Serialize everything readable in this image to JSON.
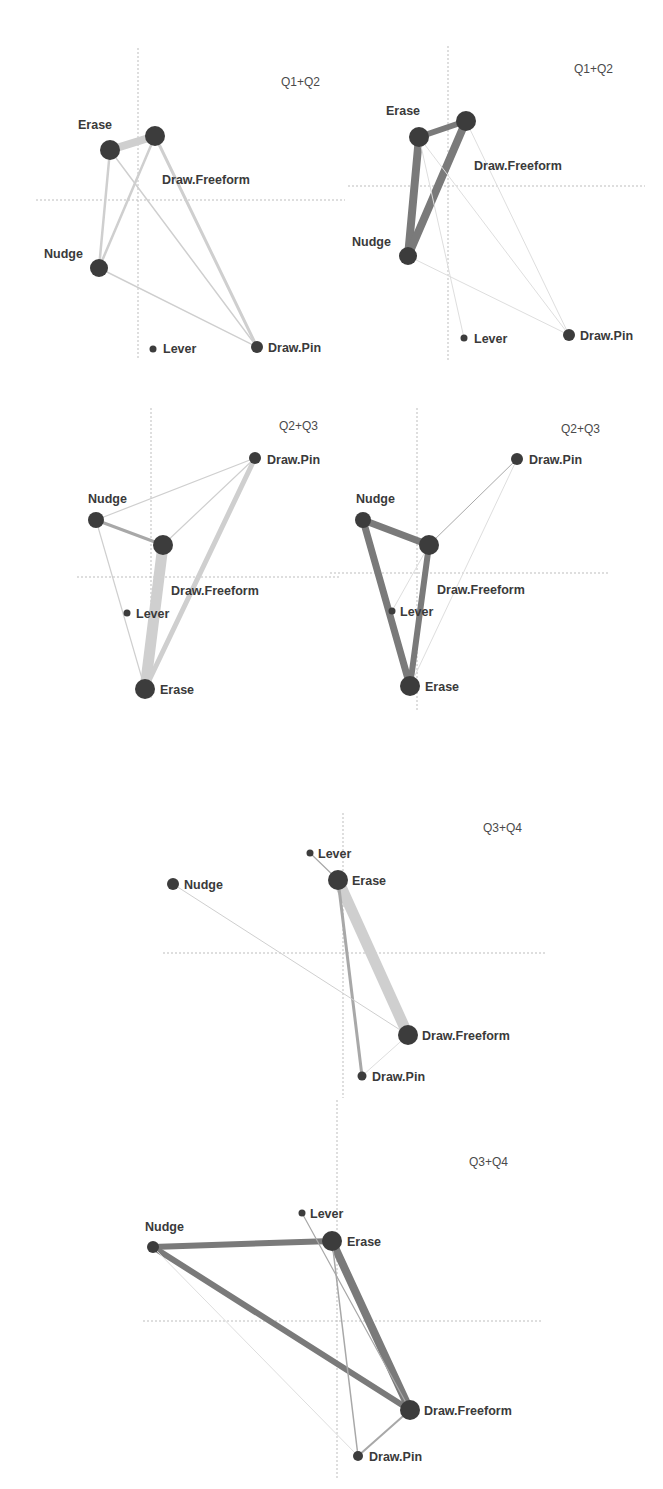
{
  "figure": {
    "width": 663,
    "height": 1489,
    "colors": {
      "node": "#3c3c3c",
      "label": "#3a3a3a",
      "axis": "#bdbdbd",
      "edge_light": "#cfcfcf",
      "edge_mid": "#a8a8a8",
      "edge_dark": "#7a7a7a",
      "edge_faint": "#dedede"
    }
  },
  "panels": [
    {
      "id": "q1q2-left",
      "title": "Q1+Q2",
      "title_pos": [
        281,
        86
      ],
      "axes": {
        "v": {
          "x": 138,
          "y1": 48,
          "y2": 360
        },
        "h": {
          "y": 200,
          "x1": 36,
          "x2": 345
        }
      },
      "nodes": [
        {
          "name": "Erase",
          "x": 110,
          "y": 150,
          "r": 10,
          "label": "Erase",
          "lx": 78,
          "ly": 129
        },
        {
          "name": "Draw.Freeform",
          "x": 155,
          "y": 136,
          "r": 10,
          "label": "Draw.Freeform",
          "lx": 162,
          "ly": 184
        },
        {
          "name": "Nudge",
          "x": 99,
          "y": 268,
          "r": 9,
          "label": "Nudge",
          "lx": 44,
          "ly": 258
        },
        {
          "name": "Lever",
          "x": 153,
          "y": 349,
          "r": 3.5,
          "label": "Lever",
          "lx": 163,
          "ly": 353
        },
        {
          "name": "Draw.Pin",
          "x": 257,
          "y": 347,
          "r": 6,
          "label": "Draw.Pin",
          "lx": 268,
          "ly": 352
        }
      ],
      "edges": [
        {
          "from": "Erase",
          "to": "Draw.Freeform",
          "w": 8,
          "tone": "edge_light"
        },
        {
          "from": "Erase",
          "to": "Nudge",
          "w": 2.5,
          "tone": "edge_light"
        },
        {
          "from": "Draw.Freeform",
          "to": "Nudge",
          "w": 2.5,
          "tone": "edge_light"
        },
        {
          "from": "Draw.Freeform",
          "to": "Draw.Pin",
          "w": 3,
          "tone": "edge_light"
        },
        {
          "from": "Erase",
          "to": "Draw.Pin",
          "w": 1.5,
          "tone": "edge_light"
        },
        {
          "from": "Nudge",
          "to": "Draw.Pin",
          "w": 1.5,
          "tone": "edge_light"
        }
      ]
    },
    {
      "id": "q1q2-right",
      "title": "Q1+Q2",
      "title_pos": [
        574,
        73
      ],
      "axes": {
        "v": {
          "x": 448,
          "y1": 46,
          "y2": 360
        },
        "h": {
          "y": 186,
          "x1": 348,
          "x2": 645
        }
      },
      "nodes": [
        {
          "name": "Erase",
          "x": 419,
          "y": 137,
          "r": 10,
          "label": "Erase",
          "lx": 386,
          "ly": 115
        },
        {
          "name": "Draw.Freeform",
          "x": 466,
          "y": 121,
          "r": 10,
          "label": "Draw.Freeform",
          "lx": 474,
          "ly": 170
        },
        {
          "name": "Nudge",
          "x": 408,
          "y": 256,
          "r": 9,
          "label": "Nudge",
          "lx": 352,
          "ly": 246
        },
        {
          "name": "Lever",
          "x": 464,
          "y": 338,
          "r": 3.5,
          "label": "Lever",
          "lx": 474,
          "ly": 343
        },
        {
          "name": "Draw.Pin",
          "x": 569,
          "y": 335,
          "r": 6,
          "label": "Draw.Pin",
          "lx": 580,
          "ly": 340
        }
      ],
      "edges": [
        {
          "from": "Erase",
          "to": "Draw.Freeform",
          "w": 6,
          "tone": "edge_dark"
        },
        {
          "from": "Erase",
          "to": "Nudge",
          "w": 8,
          "tone": "edge_dark"
        },
        {
          "from": "Draw.Freeform",
          "to": "Nudge",
          "w": 8,
          "tone": "edge_dark"
        },
        {
          "from": "Draw.Freeform",
          "to": "Draw.Pin",
          "w": 1,
          "tone": "edge_faint"
        },
        {
          "from": "Erase",
          "to": "Lever",
          "w": 1,
          "tone": "edge_faint"
        },
        {
          "from": "Erase",
          "to": "Draw.Pin",
          "w": 1,
          "tone": "edge_faint"
        },
        {
          "from": "Nudge",
          "to": "Draw.Pin",
          "w": 1,
          "tone": "edge_faint"
        }
      ]
    },
    {
      "id": "q2q3-left",
      "title": "Q2+Q3",
      "title_pos": [
        279,
        430
      ],
      "axes": {
        "v": {
          "x": 151,
          "y1": 408,
          "y2": 700
        },
        "h": {
          "y": 577,
          "x1": 77,
          "x2": 340
        }
      },
      "nodes": [
        {
          "name": "Draw.Pin",
          "x": 255,
          "y": 458,
          "r": 6,
          "label": "Draw.Pin",
          "lx": 267,
          "ly": 464
        },
        {
          "name": "Nudge",
          "x": 96,
          "y": 520,
          "r": 8,
          "label": "Nudge",
          "lx": 88,
          "ly": 503
        },
        {
          "name": "Draw.Freeform",
          "x": 163,
          "y": 545,
          "r": 10,
          "label": "Draw.Freeform",
          "lx": 171,
          "ly": 595
        },
        {
          "name": "Lever",
          "x": 127,
          "y": 613,
          "r": 3.5,
          "label": "Lever",
          "lx": 136,
          "ly": 618
        },
        {
          "name": "Erase",
          "x": 145,
          "y": 689,
          "r": 10,
          "label": "Erase",
          "lx": 160,
          "ly": 694
        }
      ],
      "edges": [
        {
          "from": "Nudge",
          "to": "Draw.Pin",
          "w": 1.2,
          "tone": "edge_light"
        },
        {
          "from": "Nudge",
          "to": "Draw.Freeform",
          "w": 3,
          "tone": "edge_mid"
        },
        {
          "from": "Draw.Freeform",
          "to": "Draw.Pin",
          "w": 1.2,
          "tone": "edge_light"
        },
        {
          "from": "Draw.Freeform",
          "to": "Erase",
          "w": 11,
          "tone": "edge_light"
        },
        {
          "from": "Draw.Pin",
          "to": "Erase",
          "w": 5,
          "tone": "edge_light"
        },
        {
          "from": "Nudge",
          "to": "Erase",
          "w": 1.2,
          "tone": "edge_light"
        }
      ]
    },
    {
      "id": "q2q3-right",
      "title": "Q2+Q3",
      "title_pos": [
        561,
        433
      ],
      "axes": {
        "v": {
          "x": 417,
          "y1": 408,
          "y2": 710
        },
        "h": {
          "y": 573,
          "x1": 330,
          "x2": 608
        }
      },
      "nodes": [
        {
          "name": "Draw.Pin",
          "x": 517,
          "y": 459,
          "r": 6,
          "label": "Draw.Pin",
          "lx": 529,
          "ly": 464
        },
        {
          "name": "Nudge",
          "x": 363,
          "y": 520,
          "r": 8,
          "label": "Nudge",
          "lx": 356,
          "ly": 503
        },
        {
          "name": "Draw.Freeform",
          "x": 429,
          "y": 545,
          "r": 10,
          "label": "Draw.Freeform",
          "lx": 437,
          "ly": 594
        },
        {
          "name": "Lever",
          "x": 392,
          "y": 611,
          "r": 3.5,
          "label": "Lever",
          "lx": 400,
          "ly": 616
        },
        {
          "name": "Erase",
          "x": 410,
          "y": 686,
          "r": 10,
          "label": "Erase",
          "lx": 425,
          "ly": 691
        }
      ],
      "edges": [
        {
          "from": "Nudge",
          "to": "Draw.Freeform",
          "w": 7,
          "tone": "edge_dark"
        },
        {
          "from": "Nudge",
          "to": "Erase",
          "w": 7,
          "tone": "edge_dark"
        },
        {
          "from": "Draw.Freeform",
          "to": "Erase",
          "w": 6,
          "tone": "edge_dark"
        },
        {
          "from": "Draw.Freeform",
          "to": "Draw.Pin",
          "w": 1,
          "tone": "edge_mid"
        },
        {
          "from": "Draw.Pin",
          "to": "Erase",
          "w": 1,
          "tone": "edge_faint"
        },
        {
          "from": "Draw.Freeform",
          "to": "Lever",
          "w": 1,
          "tone": "edge_faint"
        }
      ]
    },
    {
      "id": "q3q4-top",
      "title": "Q3+Q4",
      "title_pos": [
        483,
        832
      ],
      "axes": {
        "v": {
          "x": 343,
          "y1": 813,
          "y2": 1098
        },
        "h": {
          "y": 953,
          "x1": 163,
          "x2": 545
        }
      },
      "nodes": [
        {
          "name": "Lever",
          "x": 310,
          "y": 853,
          "r": 3.5,
          "label": "Lever",
          "lx": 318,
          "ly": 858
        },
        {
          "name": "Erase",
          "x": 338,
          "y": 880,
          "r": 10,
          "label": "Erase",
          "lx": 352,
          "ly": 885
        },
        {
          "name": "Nudge",
          "x": 173,
          "y": 884,
          "r": 6,
          "label": "Nudge",
          "lx": 184,
          "ly": 889
        },
        {
          "name": "Draw.Freeform",
          "x": 408,
          "y": 1035,
          "r": 10,
          "label": "Draw.Freeform",
          "lx": 422,
          "ly": 1040
        },
        {
          "name": "Draw.Pin",
          "x": 362,
          "y": 1076,
          "r": 4.5,
          "label": "Draw.Pin",
          "lx": 372,
          "ly": 1081
        }
      ],
      "edges": [
        {
          "from": "Lever",
          "to": "Erase",
          "w": 1.2,
          "tone": "edge_mid"
        },
        {
          "from": "Erase",
          "to": "Draw.Freeform",
          "w": 11,
          "tone": "edge_light"
        },
        {
          "from": "Erase",
          "to": "Draw.Pin",
          "w": 3,
          "tone": "edge_mid"
        },
        {
          "from": "Nudge",
          "to": "Draw.Freeform",
          "w": 1,
          "tone": "edge_light"
        },
        {
          "from": "Draw.Freeform",
          "to": "Draw.Pin",
          "w": 1,
          "tone": "edge_faint"
        }
      ]
    },
    {
      "id": "q3q4-bottom",
      "title": "Q3+Q4",
      "title_pos": [
        469,
        1166
      ],
      "axes": {
        "v": {
          "x": 337,
          "y1": 1100,
          "y2": 1480
        },
        "h": {
          "y": 1321,
          "x1": 143,
          "x2": 543
        }
      },
      "nodes": [
        {
          "name": "Lever",
          "x": 302,
          "y": 1213,
          "r": 3.5,
          "label": "Lever",
          "lx": 310,
          "ly": 1218
        },
        {
          "name": "Nudge",
          "x": 153,
          "y": 1247,
          "r": 6,
          "label": "Nudge",
          "lx": 145,
          "ly": 1231
        },
        {
          "name": "Erase",
          "x": 332,
          "y": 1241,
          "r": 10,
          "label": "Erase",
          "lx": 347,
          "ly": 1246
        },
        {
          "name": "Draw.Freeform",
          "x": 410,
          "y": 1410,
          "r": 10,
          "label": "Draw.Freeform",
          "lx": 424,
          "ly": 1415
        },
        {
          "name": "Draw.Pin",
          "x": 358,
          "y": 1456,
          "r": 5,
          "label": "Draw.Pin",
          "lx": 369,
          "ly": 1461
        }
      ],
      "edges": [
        {
          "from": "Nudge",
          "to": "Erase",
          "w": 6,
          "tone": "edge_dark"
        },
        {
          "from": "Nudge",
          "to": "Draw.Freeform",
          "w": 6,
          "tone": "edge_dark"
        },
        {
          "from": "Erase",
          "to": "Draw.Freeform",
          "w": 8,
          "tone": "edge_dark"
        },
        {
          "from": "Lever",
          "to": "Draw.Freeform",
          "w": 1.2,
          "tone": "edge_mid"
        },
        {
          "from": "Erase",
          "to": "Draw.Pin",
          "w": 1.5,
          "tone": "edge_mid"
        },
        {
          "from": "Draw.Freeform",
          "to": "Draw.Pin",
          "w": 2,
          "tone": "edge_mid"
        },
        {
          "from": "Nudge",
          "to": "Draw.Pin",
          "w": 1,
          "tone": "edge_faint"
        }
      ]
    }
  ]
}
